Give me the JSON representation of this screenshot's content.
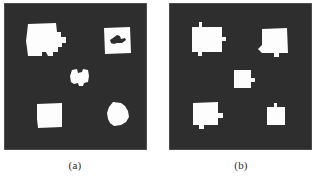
{
  "figure": {
    "background_color": "#ffffff",
    "panel_background_color": "#2e2e2e",
    "region_color": "#fdfdfd",
    "panel_count": 2
  },
  "panels": [
    {
      "id": "panel-a",
      "caption": "(a)",
      "background_color": "#2e2e2e",
      "region_color": "#fdfdfd",
      "region_count": 5,
      "regions": [
        {
          "name": "top-left-region",
          "shape": "irregular-square-with-notches",
          "x": 22,
          "y": 20,
          "width": 40,
          "height": 36,
          "has_hole": false
        },
        {
          "name": "top-right-region",
          "shape": "square-with-interior-hole",
          "x": 100,
          "y": 24,
          "width": 27,
          "height": 26,
          "has_hole": true
        },
        {
          "name": "center-region",
          "shape": "small-irregular-blob",
          "x": 66,
          "y": 66,
          "width": 19,
          "height": 19,
          "has_hole": false
        },
        {
          "name": "bottom-left-region",
          "shape": "clean-square",
          "x": 33,
          "y": 100,
          "width": 25,
          "height": 25,
          "has_hole": false
        },
        {
          "name": "bottom-right-region",
          "shape": "rounded-irregular-blob",
          "x": 103,
          "y": 99,
          "width": 22,
          "height": 24,
          "has_hole": false
        }
      ]
    },
    {
      "id": "panel-b",
      "caption": "(b)",
      "background_color": "#2e2e2e",
      "region_color": "#fdfdfd",
      "region_count": 5,
      "regions": [
        {
          "name": "top-left-region",
          "shape": "square-with-bumps",
          "x": 22,
          "y": 20,
          "width": 32,
          "height": 32,
          "has_hole": false
        },
        {
          "name": "top-right-region",
          "shape": "square-with-bumps",
          "x": 92,
          "y": 24,
          "width": 27,
          "height": 26,
          "has_hole": false
        },
        {
          "name": "center-region",
          "shape": "small-square-with-nub",
          "x": 65,
          "y": 66,
          "width": 18,
          "height": 18,
          "has_hole": false
        },
        {
          "name": "bottom-left-region",
          "shape": "square-with-nub",
          "x": 24,
          "y": 99,
          "width": 26,
          "height": 27,
          "has_hole": false
        },
        {
          "name": "bottom-right-region",
          "shape": "clean-small-square",
          "x": 97,
          "y": 102,
          "width": 19,
          "height": 20,
          "has_hole": false
        }
      ]
    }
  ]
}
